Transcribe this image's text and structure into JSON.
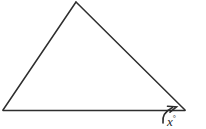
{
  "figure": {
    "kind": "geometry-diagram",
    "background_color": "#ffffff",
    "stroke_color": "#2e2e2e",
    "stroke_width": 1.5,
    "canvas": {
      "width": 206,
      "height": 129
    },
    "triangle": {
      "name": "triangle",
      "vertices": [
        {
          "id": "apex",
          "x": 76,
          "y": 2
        },
        {
          "id": "bottom-left",
          "x": 3,
          "y": 110
        },
        {
          "id": "bottom-right",
          "x": 185,
          "y": 110
        }
      ],
      "sides": [
        {
          "id": "left-side",
          "from": "bottom-left",
          "to": "apex"
        },
        {
          "id": "right-side",
          "from": "apex",
          "to": "bottom-right"
        },
        {
          "id": "base",
          "from": "bottom-left",
          "to": "bottom-right"
        }
      ]
    },
    "angle_marker": {
      "name": "exterior-angle-arc",
      "at_vertex": "bottom-right",
      "arc_path": "M 163 123 Q 161.5 113 172.5 107.5",
      "arrowhead_path": "M 167.5 106.2 L 176.5 106.8 L 170.0 112.2",
      "has_arrowhead": true,
      "stroke_color": "#2b2b2b"
    },
    "label": {
      "name": "angle-label",
      "variable": "x",
      "degree_symbol": "°",
      "text": "x°",
      "position": {
        "x": 167,
        "y": 112
      },
      "style": "italic-serif",
      "font_size_px": 13,
      "color": "#262626"
    }
  }
}
